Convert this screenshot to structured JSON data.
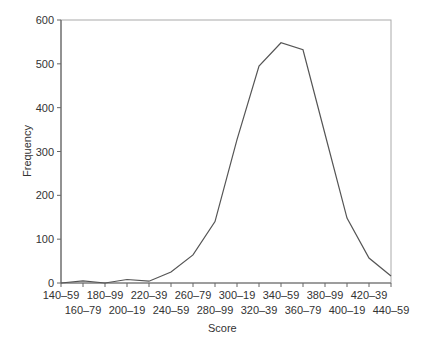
{
  "chart_data": {
    "type": "line",
    "title": "",
    "xlabel": "Score",
    "ylabel": "Frequency",
    "ylim": [
      0,
      600
    ],
    "yticks": [
      0,
      100,
      200,
      300,
      400,
      500,
      600
    ],
    "grid": false,
    "legend": null,
    "categories": [
      "140–59",
      "160–79",
      "180–99",
      "200–19",
      "220–39",
      "240–59",
      "260–79",
      "280–99",
      "300–19",
      "320–39",
      "340–59",
      "360–79",
      "380–99",
      "400–19",
      "420–39",
      "440–59"
    ],
    "values": [
      0,
      5,
      0,
      8,
      4,
      25,
      64,
      140,
      327,
      495,
      548,
      532,
      340,
      148,
      57,
      16
    ]
  },
  "labels": {
    "xlabel": "Score",
    "ylabel": "Frequency"
  },
  "style": {
    "line_color": "#555555",
    "axis_color": "#666666"
  }
}
